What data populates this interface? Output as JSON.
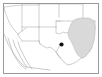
{
  "figure": {
    "kind": "locator-map-thumbnail",
    "title": "",
    "caption": "",
    "width_px": 102,
    "height_px": 77,
    "background_color": "#ffffff",
    "frame_color": "#9a9a9a",
    "border_line_color": "#b0b0b0",
    "coastline_color": "#a8a8a8",
    "highlight_fill_color": "#d9d9d9",
    "highlight_stroke_color": "#bcbcbc",
    "marker_color": "#111111"
  },
  "map": {
    "region_name": "Southwestern United States",
    "frame": {
      "x": 3,
      "y": 3,
      "width": 95,
      "height": 70
    },
    "highlight": {
      "name": "shaded-region",
      "label": "",
      "fill": "#d9d9d9",
      "points": "76,19 82,18 89,18 93,20 95,26 95,34 94,41 92,47 89,52 86,56 83,58 80,57 77,54 75,50 73,45 71,41 69,38 68,34 69,29 71,24 73,21"
    },
    "marker": {
      "name": "site-marker",
      "label": "",
      "cx": 61.5,
      "cy": 44.5,
      "r": 2.1,
      "color": "#111111"
    },
    "borders": [
      {
        "name": "nevada-west",
        "d": "M 4,7 L 5,12 L 7,17 L 9,22 L 12,27 L 15,31 L 18,34"
      },
      {
        "name": "nevada-east",
        "d": "M 22,5 L 22,20 L 22,31"
      },
      {
        "name": "nevada-south",
        "d": "M 18,34 L 22,31 L 26,28"
      },
      {
        "name": "utah-colorado",
        "d": "M 39,4 L 39,20 L 39,27"
      },
      {
        "name": "utah-south",
        "d": "M 22,27 L 39,27"
      },
      {
        "name": "arizona-newmexico",
        "d": "M 39,27 L 39,41 L 40,44"
      },
      {
        "name": "arizona-south",
        "d": "M 22,41 L 32,41 L 39,41"
      },
      {
        "name": "california-arizona",
        "d": "M 18,34 L 19,37 L 21,39 L 22,41"
      },
      {
        "name": "colorado-kansas",
        "d": "M 59,4 L 59,17"
      },
      {
        "name": "colorado-newmexico",
        "d": "M 39,27 L 48,27 L 56,27"
      },
      {
        "name": "newmexico-texas-north",
        "d": "M 56,27 L 56,21 L 61,21"
      },
      {
        "name": "kansas-oklahoma",
        "d": "M 56,21 L 59,21 L 66,21 L 75,21 L 83,21"
      },
      {
        "name": "oklahoma-texas",
        "d": "M 56,27 L 56,33 L 60,34 L 63,32 L 66,33 L 69,32 L 72,33"
      },
      {
        "name": "oklahoma-east",
        "d": "M 83,21 L 83,26 L 82,30"
      },
      {
        "name": "newmexico-texas-west",
        "d": "M 39,41 L 40,44 L 43,46 L 47,48 L 50,47 L 53,49 L 56,52 L 59,47 L 61,44"
      },
      {
        "name": "kansas-north",
        "d": "M 59,4 L 72,4 L 83,4"
      },
      {
        "name": "kansas-east",
        "d": "M 83,4 L 83,21"
      },
      {
        "name": "missouri-arkansas",
        "d": "M 83,21 L 90,21 L 95,21"
      },
      {
        "name": "arkansas-louisiana",
        "d": "M 95,21 L 95,30"
      },
      {
        "name": "utah-wyoming-north",
        "d": "M 22,5 L 39,5 L 39,4"
      },
      {
        "name": "colorado-north",
        "d": "M 39,4 L 48,4 L 59,4"
      },
      {
        "name": "nevada-north",
        "d": "M 4,7 L 12,6 L 22,5"
      }
    ],
    "coastlines": [
      {
        "name": "pacific-coast-california",
        "d": "M 4,34 L 6,39 L 8,44 L 11,49 L 14,54 L 17,58 L 20,62 L 23,65 L 26,67"
      },
      {
        "name": "baja-west-coast",
        "d": "M 8,38 L 10,44 L 12,50 L 14,55 L 17,60 L 20,64 L 23,67 L 26,69"
      },
      {
        "name": "baja-east-coast",
        "d": "M 13,40 L 15,46 L 18,52 L 21,58 L 24,63 L 27,67"
      },
      {
        "name": "gulf-california-inner",
        "d": "M 18,42 L 20,48 L 23,54 L 26,60 L 29,65 L 32,69"
      },
      {
        "name": "mexico-north-coast",
        "d": "M 26,67 L 34,68 L 42,69 L 50,70"
      },
      {
        "name": "texas-gulf-coast",
        "d": "M 56,52 L 59,56 L 62,60 L 65,63 L 68,65 L 72,64 L 76,62 L 80,59 L 83,57"
      },
      {
        "name": "gulf-coast-east",
        "d": "M 83,57 L 87,54 L 90,51 L 92,47"
      },
      {
        "name": "rio-grande-mouth",
        "d": "M 56,52 L 58,55 L 60,58"
      }
    ]
  }
}
